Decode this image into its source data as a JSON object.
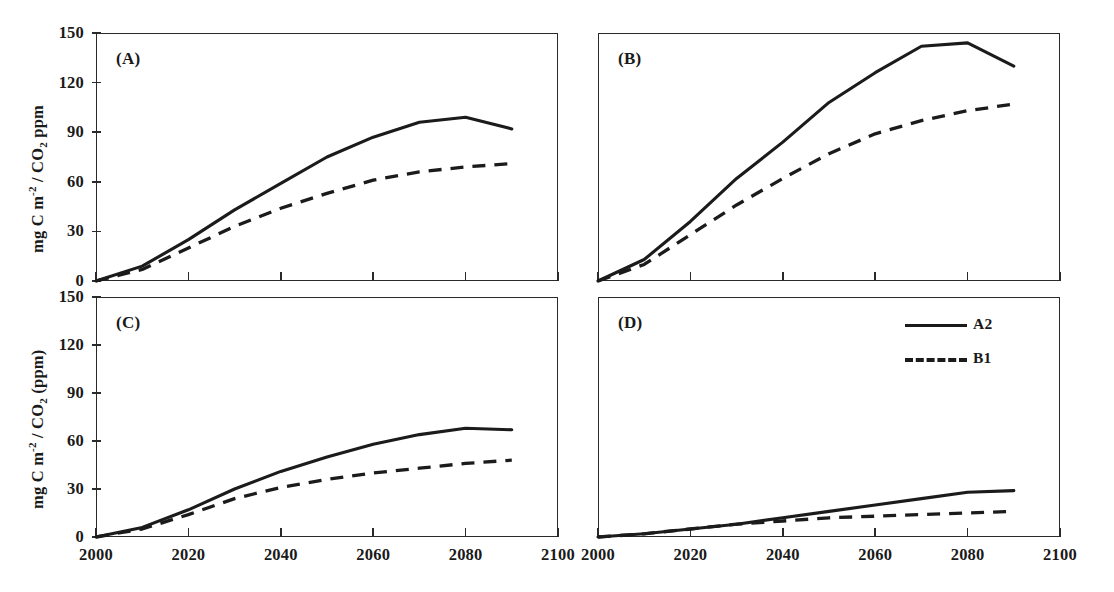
{
  "figure": {
    "background": "#ffffff",
    "line_color": "#1b1b1b",
    "panels": [
      {
        "id": "A",
        "letter": "(A)",
        "y_axis_title": "mg C m-2 / CO2 ppm",
        "show_y_ticklabels": true,
        "show_x_ticklabels": false
      },
      {
        "id": "B",
        "letter": "(B)",
        "y_axis_title": "",
        "show_y_ticklabels": false,
        "show_x_ticklabels": false
      },
      {
        "id": "C",
        "letter": "(C)",
        "y_axis_title": "mg C m-2 / CO2 (ppm)",
        "show_y_ticklabels": true,
        "show_x_ticklabels": true
      },
      {
        "id": "D",
        "letter": "(D)",
        "y_axis_title": "",
        "show_y_ticklabels": false,
        "show_x_ticklabels": true
      }
    ],
    "legend": {
      "panel": "D",
      "entries": [
        {
          "label": "A2",
          "style": "solid"
        },
        {
          "label": "B1",
          "style": "dashed"
        }
      ]
    },
    "y_ticklabels": [
      "0",
      "30",
      "60",
      "90",
      "120",
      "150"
    ],
    "x_ticklabels": [
      "2000",
      "2020",
      "2040",
      "2060",
      "2080",
      "2100"
    ]
  },
  "chart_data": [
    {
      "type": "line",
      "panel": "A",
      "title": "(A)",
      "xlabel": "",
      "ylabel": "mg C m-2 / CO2 ppm",
      "xlim": [
        2000,
        2100
      ],
      "ylim": [
        0,
        150
      ],
      "xticks": [
        2000,
        2020,
        2040,
        2060,
        2080,
        2100
      ],
      "yticks": [
        0,
        30,
        60,
        90,
        120,
        150
      ],
      "grid": false,
      "legend_position": "none",
      "x": [
        2000,
        2010,
        2020,
        2030,
        2040,
        2050,
        2060,
        2070,
        2080,
        2090
      ],
      "series": [
        {
          "name": "A2",
          "style": "solid",
          "values": [
            0,
            9,
            25,
            43,
            59,
            75,
            87,
            96,
            99,
            92
          ]
        },
        {
          "name": "B1",
          "style": "dashed",
          "values": [
            0,
            7,
            20,
            33,
            44,
            53,
            61,
            66,
            69,
            71
          ]
        }
      ]
    },
    {
      "type": "line",
      "panel": "B",
      "title": "(B)",
      "xlabel": "",
      "ylabel": "",
      "xlim": [
        2000,
        2100
      ],
      "ylim": [
        0,
        150
      ],
      "xticks": [
        2000,
        2020,
        2040,
        2060,
        2080,
        2100
      ],
      "yticks": [
        0,
        30,
        60,
        90,
        120,
        150
      ],
      "grid": false,
      "legend_position": "none",
      "x": [
        2000,
        2010,
        2020,
        2030,
        2040,
        2050,
        2060,
        2070,
        2080,
        2090
      ],
      "series": [
        {
          "name": "A2",
          "style": "solid",
          "values": [
            0,
            13,
            36,
            62,
            84,
            108,
            126,
            142,
            144,
            130
          ]
        },
        {
          "name": "B1",
          "style": "dashed",
          "values": [
            0,
            10,
            28,
            46,
            62,
            77,
            89,
            97,
            103,
            107
          ]
        }
      ]
    },
    {
      "type": "line",
      "panel": "C",
      "title": "(C)",
      "xlabel": "",
      "ylabel": "mg C m-2 / CO2 (ppm)",
      "xlim": [
        2000,
        2100
      ],
      "ylim": [
        0,
        150
      ],
      "xticks": [
        2000,
        2020,
        2040,
        2060,
        2080,
        2100
      ],
      "yticks": [
        0,
        30,
        60,
        90,
        120,
        150
      ],
      "grid": false,
      "legend_position": "none",
      "x": [
        2000,
        2010,
        2020,
        2030,
        2040,
        2050,
        2060,
        2070,
        2080,
        2090
      ],
      "series": [
        {
          "name": "A2",
          "style": "solid",
          "values": [
            0,
            6,
            17,
            30,
            41,
            50,
            58,
            64,
            68,
            67
          ]
        },
        {
          "name": "B1",
          "style": "dashed",
          "values": [
            0,
            5,
            14,
            24,
            31,
            36,
            40,
            43,
            46,
            48
          ]
        }
      ]
    },
    {
      "type": "line",
      "panel": "D",
      "title": "(D)",
      "xlabel": "",
      "ylabel": "",
      "xlim": [
        2000,
        2100
      ],
      "ylim": [
        0,
        150
      ],
      "xticks": [
        2000,
        2020,
        2040,
        2060,
        2080,
        2100
      ],
      "yticks": [
        0,
        30,
        60,
        90,
        120,
        150
      ],
      "grid": false,
      "legend_position": "top-right",
      "x": [
        2000,
        2010,
        2020,
        2030,
        2040,
        2050,
        2060,
        2070,
        2080,
        2090
      ],
      "series": [
        {
          "name": "A2",
          "style": "solid",
          "values": [
            0,
            2,
            5,
            8,
            12,
            16,
            20,
            24,
            28,
            29
          ]
        },
        {
          "name": "B1",
          "style": "dashed",
          "values": [
            0,
            2,
            5,
            8,
            10,
            12,
            13,
            14,
            15,
            16
          ]
        }
      ]
    }
  ]
}
